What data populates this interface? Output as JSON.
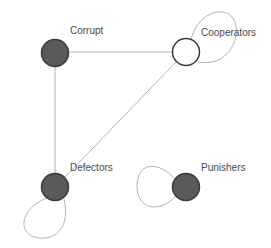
{
  "diagram": {
    "type": "network-graph",
    "colors": {
      "filled_node": "#5a5a5a",
      "hollow_node": "#ffffff",
      "node_stroke": "#3a3a3a",
      "edge": "#b4b4b4",
      "label": "#4a4a4a"
    },
    "nodes": [
      {
        "id": "corrupt",
        "label": "Corrupt",
        "filled": true,
        "x": 55,
        "y": 53
      },
      {
        "id": "cooperators",
        "label": "Cooperators",
        "filled": false,
        "x": 186,
        "y": 52
      },
      {
        "id": "defectors",
        "label": "Defectors",
        "filled": true,
        "x": 55,
        "y": 187
      },
      {
        "id": "punishers",
        "label": "Punishers",
        "filled": true,
        "x": 186,
        "y": 187
      }
    ],
    "edges": [
      {
        "from": "corrupt",
        "to": "cooperators"
      },
      {
        "from": "corrupt",
        "to": "defectors"
      },
      {
        "from": "cooperators",
        "to": "defectors"
      }
    ],
    "self_loops": [
      {
        "node": "cooperators",
        "direction": "upper-right"
      },
      {
        "node": "defectors",
        "direction": "lower-left"
      },
      {
        "node": "punishers",
        "direction": "left"
      }
    ]
  }
}
